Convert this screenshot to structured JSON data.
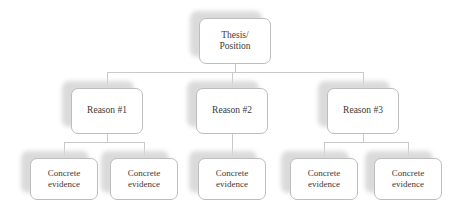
{
  "diagram": {
    "type": "hierarchy-tree",
    "colors": {
      "background": "#ffffff",
      "node_fill": "#ffffff",
      "node_border": "#bdbdbd",
      "shadow": "#d9d9d9",
      "connector": "#c9c9c9",
      "text": "#3a3a3a"
    },
    "root": {
      "id": "thesis",
      "label": "Thesis/\nPosition",
      "x": 199,
      "y": 18,
      "w": 72,
      "h": 46
    },
    "reasons": [
      {
        "id": "reason-1",
        "label": "Reason #1",
        "x": 71,
        "y": 88,
        "w": 72,
        "h": 46
      },
      {
        "id": "reason-2",
        "label": "Reason #2",
        "x": 196,
        "y": 88,
        "w": 72,
        "h": 46
      },
      {
        "id": "reason-3",
        "label": "Reason #3",
        "x": 327,
        "y": 88,
        "w": 72,
        "h": 46
      }
    ],
    "evidence": [
      {
        "id": "evidence-1",
        "parent": "reason-1",
        "label": "Concrete\nevidence",
        "x": 30,
        "y": 158,
        "w": 68,
        "h": 42
      },
      {
        "id": "evidence-2",
        "parent": "reason-1",
        "label": "Concrete\nevidence",
        "x": 110,
        "y": 158,
        "w": 68,
        "h": 42
      },
      {
        "id": "evidence-3",
        "parent": "reason-2",
        "label": "Concrete\nevidence",
        "x": 198,
        "y": 158,
        "w": 68,
        "h": 42
      },
      {
        "id": "evidence-4",
        "parent": "reason-3",
        "label": "Concrete\nevidence",
        "x": 290,
        "y": 158,
        "w": 68,
        "h": 42
      },
      {
        "id": "evidence-5",
        "parent": "reason-3",
        "label": "Concrete\nevidence",
        "x": 374,
        "y": 158,
        "w": 68,
        "h": 42
      }
    ],
    "connectors": {
      "thesis_stem": {
        "x": 235,
        "y": 64,
        "h": 8
      },
      "reason_bus": {
        "x": 107,
        "y": 72,
        "w": 256
      },
      "reason_drops": [
        {
          "x": 107,
          "y": 72,
          "h": 16
        },
        {
          "x": 232,
          "y": 72,
          "h": 16
        },
        {
          "x": 363,
          "y": 72,
          "h": 16
        }
      ],
      "branch_1": {
        "stem": {
          "x": 107,
          "y": 134,
          "h": 8
        },
        "bus": {
          "x": 64,
          "y": 142,
          "w": 80
        },
        "drops": [
          {
            "x": 64,
            "y": 142,
            "h": 16
          },
          {
            "x": 144,
            "y": 142,
            "h": 16
          }
        ]
      },
      "branch_2": {
        "stem": {
          "x": 232,
          "y": 134,
          "h": 24
        }
      },
      "branch_3": {
        "stem": {
          "x": 363,
          "y": 134,
          "h": 8
        },
        "bus": {
          "x": 324,
          "y": 142,
          "w": 84
        },
        "drops": [
          {
            "x": 324,
            "y": 142,
            "h": 16
          },
          {
            "x": 408,
            "y": 142,
            "h": 16
          }
        ]
      }
    }
  }
}
